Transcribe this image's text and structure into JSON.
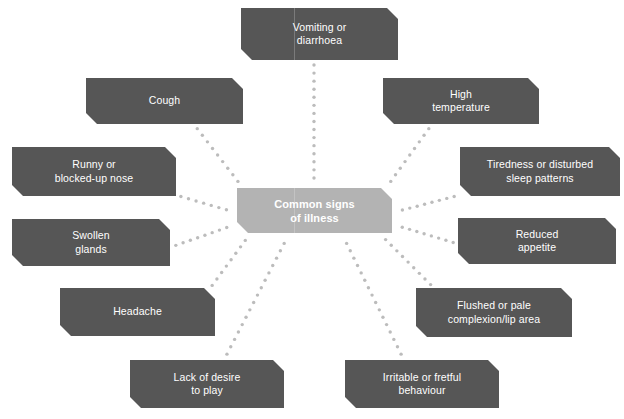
{
  "diagram": {
    "type": "radial-mind-map",
    "title": "Common signs of illness",
    "colors": {
      "background": "#ffffff",
      "node_fill": "#565656",
      "center_fill": "#b3b3b3",
      "node_text": "#ffffff",
      "connector_dot": "#bcbcbc"
    },
    "center": {
      "label": "Common signs\nof illness",
      "x": 237,
      "y": 188,
      "w": 155,
      "h": 45
    },
    "nodes": [
      {
        "id": "vomiting-or-diarrhoea",
        "label": "Vomiting or\ndiarrhoea",
        "x": 241,
        "y": 8,
        "w": 157,
        "h": 52
      },
      {
        "id": "cough",
        "label": "Cough",
        "x": 86,
        "y": 78,
        "w": 157,
        "h": 46
      },
      {
        "id": "high-temperature",
        "label": "High\ntemperature",
        "x": 383,
        "y": 78,
        "w": 156,
        "h": 46
      },
      {
        "id": "runny-or-blocked-up-nose",
        "label": "Runny or\nblocked-up nose",
        "x": 12,
        "y": 147,
        "w": 164,
        "h": 49
      },
      {
        "id": "tiredness-or-disturbed-sleep",
        "label": "Tiredness or disturbed\nsleep patterns",
        "x": 460,
        "y": 147,
        "w": 160,
        "h": 49
      },
      {
        "id": "swollen-glands",
        "label": "Swollen\nglands",
        "x": 12,
        "y": 219,
        "w": 158,
        "h": 47
      },
      {
        "id": "reduced-appetite",
        "label": "Reduced\nappetite",
        "x": 458,
        "y": 218,
        "w": 158,
        "h": 46
      },
      {
        "id": "headache",
        "label": "Headache",
        "x": 60,
        "y": 288,
        "w": 155,
        "h": 48
      },
      {
        "id": "flushed-or-pale-complexion",
        "label": "Flushed or pale\ncomplexion/lip area",
        "x": 416,
        "y": 288,
        "w": 156,
        "h": 49
      },
      {
        "id": "lack-of-desire-to-play",
        "label": "Lack of desire\nto play",
        "x": 130,
        "y": 360,
        "w": 154,
        "h": 48
      },
      {
        "id": "irritable-or-fretful-behaviour",
        "label": "Irritable or fretful\nbehaviour",
        "x": 345,
        "y": 360,
        "w": 154,
        "h": 48
      }
    ],
    "connectors": [
      {
        "from": "center",
        "to": "vomiting-or-diarrhoea",
        "x1": 314,
        "y1": 186,
        "x2": 314,
        "y2": 63
      },
      {
        "from": "center",
        "to": "cough",
        "x1": 243,
        "y1": 188,
        "x2": 196,
        "y2": 127
      },
      {
        "from": "center",
        "to": "high-temperature",
        "x1": 386,
        "y1": 188,
        "x2": 430,
        "y2": 127
      },
      {
        "from": "center",
        "to": "runny-or-blocked-up-nose",
        "x1": 234,
        "y1": 212,
        "x2": 179,
        "y2": 196
      },
      {
        "from": "center",
        "to": "tiredness-or-disturbed-sleep",
        "x1": 395,
        "y1": 212,
        "x2": 456,
        "y2": 196
      },
      {
        "from": "center",
        "to": "swollen-glands",
        "x1": 234,
        "y1": 225,
        "x2": 174,
        "y2": 246
      },
      {
        "from": "center",
        "to": "reduced-appetite",
        "x1": 395,
        "y1": 225,
        "x2": 455,
        "y2": 243
      },
      {
        "from": "center",
        "to": "headache",
        "x1": 250,
        "y1": 234,
        "x2": 211,
        "y2": 287
      },
      {
        "from": "center",
        "to": "flushed-or-pale-complexion",
        "x1": 380,
        "y1": 234,
        "x2": 432,
        "y2": 286
      },
      {
        "from": "center",
        "to": "lack-of-desire-to-play",
        "x1": 288,
        "y1": 236,
        "x2": 226,
        "y2": 356
      },
      {
        "from": "center",
        "to": "irritable-or-fretful-behaviour",
        "x1": 343,
        "y1": 236,
        "x2": 402,
        "y2": 356
      }
    ]
  }
}
